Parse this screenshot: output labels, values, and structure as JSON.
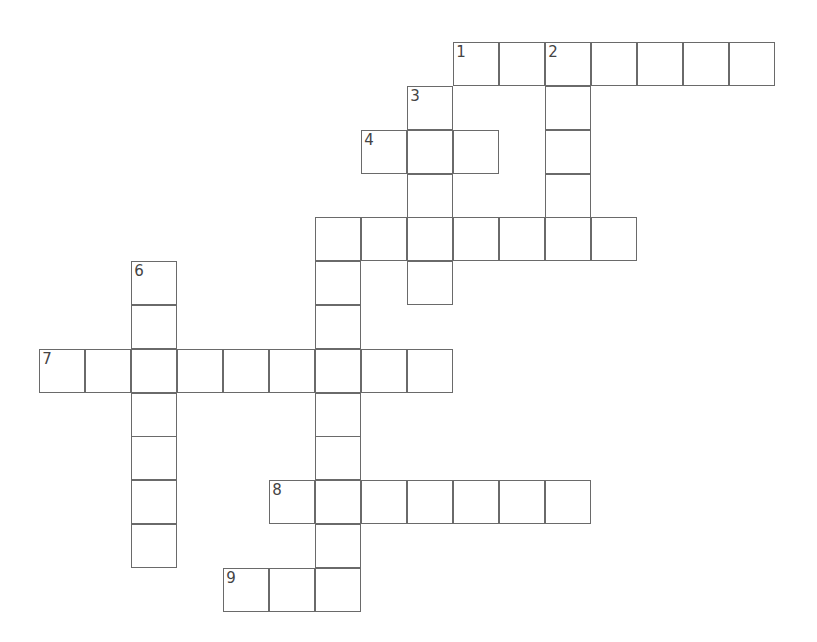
{
  "puzzle": {
    "type": "crossword",
    "entries": [
      {
        "number": "1",
        "direction": "across",
        "row": 0,
        "col": 9,
        "length": 7
      },
      {
        "number": "2",
        "direction": "down",
        "row": 0,
        "col": 11,
        "length": 5
      },
      {
        "number": "3",
        "direction": "down",
        "row": 1,
        "col": 8,
        "length": 5
      },
      {
        "number": "4",
        "direction": "across",
        "row": 2,
        "col": 7,
        "length": 3
      },
      {
        "number": "",
        "direction": "across",
        "row": 4,
        "col": 6,
        "length": 7
      },
      {
        "number": "",
        "direction": "down",
        "row": 4,
        "col": 6,
        "length": 9
      },
      {
        "number": "6",
        "direction": "down",
        "row": 5,
        "col": 2,
        "length": 7
      },
      {
        "number": "7",
        "direction": "across",
        "row": 7,
        "col": 0,
        "length": 9
      },
      {
        "number": "8",
        "direction": "across",
        "row": 10,
        "col": 5,
        "length": 7
      },
      {
        "number": "9",
        "direction": "across",
        "row": 12,
        "col": 4,
        "length": 3
      }
    ]
  }
}
